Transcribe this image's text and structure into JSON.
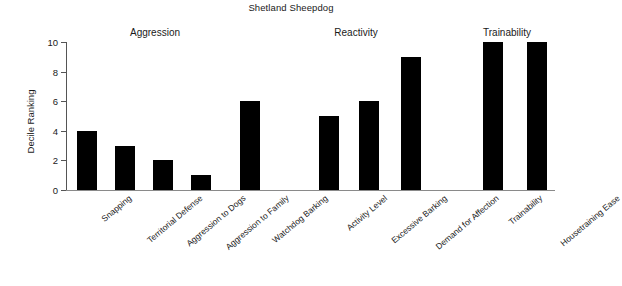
{
  "chart_data": {
    "type": "bar",
    "title": "Shetland Sheepdog",
    "xlabel": "",
    "ylabel": "Decile Ranking",
    "ylim": [
      0,
      10
    ],
    "yticks": [
      0,
      2,
      4,
      6,
      8,
      10
    ],
    "grid": false,
    "legend": "none",
    "categories": [
      "Snapping",
      "Territorial Defense",
      "Aggression to Dogs",
      "Aggression to Family",
      "Watchdog Barking",
      "Activity Level",
      "Excessive Barking",
      "Demand for Affection",
      "Trainability",
      "Housetraining Ease"
    ],
    "values": [
      4,
      3,
      2,
      1,
      6,
      5,
      6,
      9,
      10,
      10
    ],
    "bar_color": "#000000",
    "groups": [
      {
        "label": "Aggression",
        "center_x": 155,
        "categories": [
          "Snapping",
          "Territorial Defense",
          "Aggression to Dogs",
          "Aggression to Family",
          "Watchdog Barking"
        ],
        "values": [
          4,
          3,
          2,
          1,
          6
        ]
      },
      {
        "label": "Reactivity",
        "center_x": 356,
        "categories": [
          "Activity Level",
          "Excessive Barking",
          "Demand for Affection"
        ],
        "values": [
          5,
          6,
          9
        ]
      },
      {
        "label": "Trainability",
        "center_x": 507,
        "categories": [
          "Trainability",
          "Housetraining Ease"
        ],
        "values": [
          10,
          10
        ]
      }
    ]
  },
  "bars": [
    {
      "label": "Snapping",
      "value": 4,
      "x": 77
    },
    {
      "label": "Territorial Defense",
      "value": 3,
      "x": 115
    },
    {
      "label": "Aggression to Dogs",
      "value": 2,
      "x": 153
    },
    {
      "label": "Aggression to Family",
      "value": 1,
      "x": 191
    },
    {
      "label": "Watchdog Barking",
      "value": 6,
      "x": 240
    },
    {
      "label": "Activity Level",
      "value": 5,
      "x": 319
    },
    {
      "label": "Excessive Barking",
      "value": 6,
      "x": 359
    },
    {
      "label": "Demand for Affection",
      "value": 9,
      "x": 401
    },
    {
      "label": "Trainability",
      "value": 10,
      "x": 483
    },
    {
      "label": "Housetraining Ease",
      "value": 10,
      "x": 527
    }
  ],
  "yticks": [
    {
      "value": 10,
      "label": "10"
    },
    {
      "value": 8,
      "label": "8"
    },
    {
      "value": 6,
      "label": "6"
    },
    {
      "value": 4,
      "label": "4"
    },
    {
      "value": 2,
      "label": "2"
    },
    {
      "value": 0,
      "label": "0"
    }
  ]
}
